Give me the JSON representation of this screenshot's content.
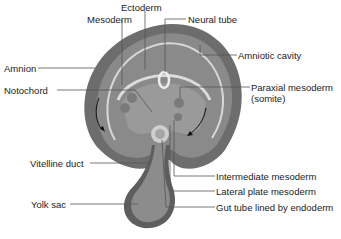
{
  "diagram": {
    "labels": {
      "ectoderm": "Ectoderm",
      "mesoderm": "Mesoderm",
      "neural_tube": "Neural tube",
      "amniotic_cavity": "Amniotic cavity",
      "amnion": "Amnion",
      "notochord": "Notochord",
      "paraxial_mesoderm_line1": "Paraxial mesoderm",
      "paraxial_mesoderm_line2": "(somite)",
      "vitelline_duct": "Vitelline duct",
      "intermediate_mesoderm": "Intermediate mesoderm",
      "lateral_plate_mesoderm": "Lateral plate mesoderm",
      "yolk_sac": "Yolk sac",
      "gut_tube": "Gut tube lined by endoderm"
    },
    "colors": {
      "outer_amnion": "#6d6d6d",
      "amniotic_cavity": "#8a8a8a",
      "ectoderm_band": "#d8d8d8",
      "inner_body": "#9a9a9a",
      "yolk_sac": "#8c8c8c",
      "leader_line": "#555555"
    }
  }
}
